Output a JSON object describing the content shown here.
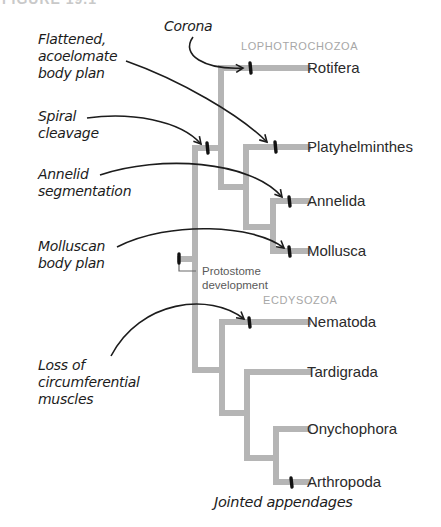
{
  "figure": {
    "header_partial": "FIGURE 19.1"
  },
  "colors": {
    "branch": "#b5b5b5",
    "marker": "#111111",
    "clade_label": "#a7a7a7",
    "text": "#2a2a2a"
  },
  "clades": {
    "lophotrochozoa": "LOPHOTROCHOZOA",
    "ecdysozoa": "ECDYSOZOA"
  },
  "taxa": [
    {
      "name": "Rotifera"
    },
    {
      "name": "Platyhelminthes"
    },
    {
      "name": "Annelida"
    },
    {
      "name": "Mollusca"
    },
    {
      "name": "Nematoda"
    },
    {
      "name": "Tardigrada"
    },
    {
      "name": "Onychophora"
    },
    {
      "name": "Arthropoda"
    }
  ],
  "annotations": {
    "corona": "Corona",
    "flattened_l1": "Flattened,",
    "flattened_l2": "acoelomate",
    "flattened_l3": "body plan",
    "spiral_l1": "Spiral",
    "spiral_l2": "cleavage",
    "annelid_l1": "Annelid",
    "annelid_l2": "segmentation",
    "molluscan_l1": "Molluscan",
    "molluscan_l2": "body plan",
    "loss_l1": "Loss of",
    "loss_l2": "circumferential",
    "loss_l3": "muscles",
    "jointed": "Jointed appendages",
    "protostome_l1": "Protostome",
    "protostome_l2": "development"
  }
}
